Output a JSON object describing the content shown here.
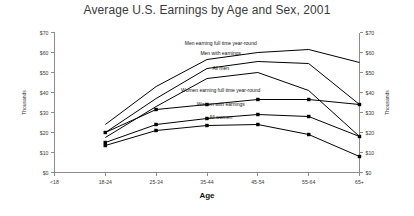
{
  "chart_data": {
    "type": "line",
    "title": "Average U.S. Earnings by Age and Sex, 2001",
    "xlabel": "Age",
    "ylabel": "Thousands",
    "ylabel_right": "Thousands",
    "categories": [
      "<18",
      "18-24",
      "25-34",
      "35-44",
      "45-54",
      "55-64",
      "65+"
    ],
    "ylim": [
      0,
      70
    ],
    "yticks": [
      0,
      10,
      20,
      30,
      40,
      50,
      60,
      70
    ],
    "ytick_labels": [
      "$0",
      "$10",
      "$20",
      "$30",
      "$40",
      "$50",
      "$60",
      "$70"
    ],
    "grid": false,
    "legend": "inline-labels",
    "series": [
      {
        "name": "Men earning full time year-round",
        "label": "Men earning full time year-round",
        "markers": false,
        "values": [
          null,
          24.0,
          43.0,
          56.5,
          60.0,
          61.5,
          55.0
        ]
      },
      {
        "name": "Men with earnings",
        "label": "Men with earnings",
        "markers": false,
        "values": [
          null,
          20.0,
          37.0,
          52.0,
          55.5,
          54.5,
          34.0
        ]
      },
      {
        "name": "All men",
        "label": "All men",
        "markers": false,
        "values": [
          null,
          17.5,
          33.0,
          47.0,
          50.0,
          41.0,
          18.0
        ]
      },
      {
        "name": "Women earning full time year-round",
        "label": "Women earning full time year-round",
        "markers": true,
        "values": [
          null,
          20.0,
          31.5,
          34.0,
          36.5,
          36.5,
          34.0
        ]
      },
      {
        "name": "Women with earnings",
        "label": "Women with earnings",
        "markers": true,
        "values": [
          null,
          15.0,
          24.0,
          27.0,
          29.0,
          28.0,
          18.0
        ]
      },
      {
        "name": "All women",
        "label": "All women",
        "markers": true,
        "values": [
          null,
          13.5,
          21.0,
          23.5,
          24.0,
          19.0,
          8.0
        ]
      }
    ],
    "label_positions": [
      {
        "series": 0,
        "x_frac": 0.545,
        "value": 64.0
      },
      {
        "series": 1,
        "x_frac": 0.545,
        "value": 59.0
      },
      {
        "series": 2,
        "x_frac": 0.545,
        "value": 51.5
      },
      {
        "series": 3,
        "x_frac": 0.545,
        "value": 40.5
      },
      {
        "series": 4,
        "x_frac": 0.545,
        "value": 33.5
      },
      {
        "series": 5,
        "x_frac": 0.545,
        "value": 27.0
      }
    ],
    "colors": {
      "line": "#000000",
      "axis": "#8c8c8c",
      "text": "#3a3a3a",
      "background": "#ffffff"
    }
  }
}
